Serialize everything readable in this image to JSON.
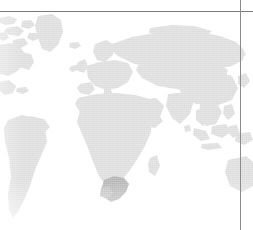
{
  "figure": {
    "kind": "world-map",
    "projection": "equirectangular",
    "width": 253,
    "height": 230,
    "background_color": "#ffffff",
    "land_color": "#dcdcdc",
    "land_color_light": "#e4e4e4",
    "highlight_color": "#b0b0b0",
    "rule_color": "#7a7a7a",
    "cropped_edges": [
      "left",
      "bottom",
      "right"
    ]
  },
  "frame": {
    "horizontal_rule": {
      "name": "top-border-rule",
      "y": 11,
      "x_start": 0,
      "x_end": 253,
      "thickness": 1,
      "color": "#7a7a7a"
    },
    "vertical_rule": {
      "name": "right-border-rule",
      "x": 240,
      "y_start": 0,
      "y_end": 230,
      "thickness": 1,
      "color": "#8a8a8a"
    }
  },
  "highlight": {
    "region_name": "South Africa",
    "color": "#b0b0b0",
    "center_x": 116,
    "center_y": 192
  },
  "landmasses": [
    {
      "name": "Greenland",
      "visible": true,
      "cropped": false
    },
    {
      "name": "Canadian Arctic",
      "visible": true,
      "cropped": true
    },
    {
      "name": "North America",
      "visible": true,
      "cropped": true
    },
    {
      "name": "South America",
      "visible": true,
      "cropped": true
    },
    {
      "name": "Europe",
      "visible": true,
      "cropped": false
    },
    {
      "name": "Africa",
      "visible": true,
      "cropped": false
    },
    {
      "name": "Asia",
      "visible": true,
      "cropped": false
    },
    {
      "name": "Russia",
      "visible": true,
      "cropped": false
    },
    {
      "name": "Middle East",
      "visible": true,
      "cropped": false
    },
    {
      "name": "India",
      "visible": true,
      "cropped": false
    },
    {
      "name": "Southeast Asia",
      "visible": true,
      "cropped": false
    },
    {
      "name": "Indonesia",
      "visible": true,
      "cropped": false
    },
    {
      "name": "Japan",
      "visible": true,
      "cropped": false
    },
    {
      "name": "Australia",
      "visible": true,
      "cropped": true
    },
    {
      "name": "Madagascar",
      "visible": true,
      "cropped": false
    },
    {
      "name": "British Isles",
      "visible": true,
      "cropped": false
    },
    {
      "name": "Iceland",
      "visible": true,
      "cropped": false
    },
    {
      "name": "Scandinavia",
      "visible": true,
      "cropped": false
    }
  ]
}
